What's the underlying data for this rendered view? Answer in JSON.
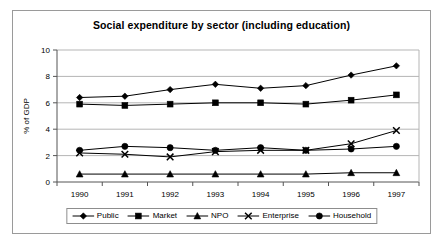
{
  "chart_data": {
    "type": "line",
    "title": "Social expenditure by sector (including education)",
    "xlabel": "",
    "ylabel": "% of GDP",
    "categories": [
      "1990",
      "1991",
      "1992",
      "1993",
      "1994",
      "1995",
      "1996",
      "1997"
    ],
    "x": [
      1990,
      1991,
      1992,
      1993,
      1994,
      1995,
      1996,
      1997
    ],
    "ylim": [
      0,
      10
    ],
    "yticks": [
      0,
      2,
      4,
      6,
      8,
      10
    ],
    "ytick_labels": [
      "0",
      "2",
      "4",
      "6",
      "8",
      "10"
    ],
    "grid": "horizontal",
    "legend_position": "bottom",
    "series": [
      {
        "name": "Public",
        "marker": "diamond",
        "color": "#000000",
        "values": [
          6.4,
          6.5,
          7.0,
          7.4,
          7.1,
          7.3,
          8.1,
          8.8
        ]
      },
      {
        "name": "Market",
        "marker": "square",
        "color": "#000000",
        "values": [
          5.9,
          5.8,
          5.9,
          6.0,
          6.0,
          5.9,
          6.2,
          6.6
        ]
      },
      {
        "name": "NPO",
        "marker": "triangle",
        "color": "#000000",
        "values": [
          0.6,
          0.6,
          0.6,
          0.6,
          0.6,
          0.6,
          0.7,
          0.7
        ]
      },
      {
        "name": "Enterprise",
        "marker": "cross",
        "color": "#000000",
        "values": [
          2.2,
          2.1,
          1.9,
          2.3,
          2.4,
          2.4,
          2.9,
          3.9
        ]
      },
      {
        "name": "Household",
        "marker": "circle",
        "color": "#000000",
        "values": [
          2.4,
          2.7,
          2.6,
          2.4,
          2.6,
          2.4,
          2.5,
          2.7
        ]
      }
    ]
  }
}
